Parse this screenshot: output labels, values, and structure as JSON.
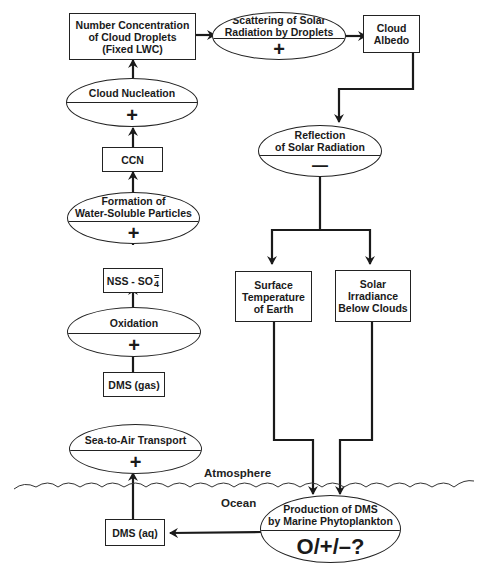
{
  "nodes": {
    "number_concentration": [
      "Number Concentration",
      "of Cloud Droplets",
      "(Fixed LWC)"
    ],
    "scattering": {
      "title": [
        "Scattering of Solar",
        "Radiation by Droplets"
      ],
      "sign": "+"
    },
    "cloud_albedo": [
      "Cloud",
      "Albedo"
    ],
    "cloud_nucleation": {
      "title": "Cloud Nucleation",
      "sign": "+"
    },
    "ccn": "CCN",
    "formation": {
      "title": [
        "Formation of",
        "Water-Soluble Particles"
      ],
      "sign": "+"
    },
    "nss_so4": {
      "prefix": "NSS - SO",
      "sup": "=",
      "sub": "4"
    },
    "oxidation": {
      "title": "Oxidation",
      "sign": "+"
    },
    "dms_gas": "DMS (gas)",
    "sea_to_air": {
      "title": "Sea-to-Air Transport",
      "sign": "+"
    },
    "reflection": {
      "title": [
        "Reflection",
        "of Solar Radiation"
      ],
      "sign": "—"
    },
    "surface_temp": [
      "Surface",
      "Temperature",
      "of Earth"
    ],
    "solar_irradiance": [
      "Solar",
      "Irradiance",
      "Below Clouds"
    ],
    "production_dms": {
      "title": [
        "Production of DMS",
        "by Marine Phytoplankton"
      ],
      "sign": "O/+/–?"
    },
    "dms_aq": "DMS (aq)"
  },
  "labels": {
    "atmosphere": "Atmosphere",
    "ocean": "Ocean"
  },
  "colors": {
    "line": "#1a1a1a",
    "background": "#ffffff"
  }
}
